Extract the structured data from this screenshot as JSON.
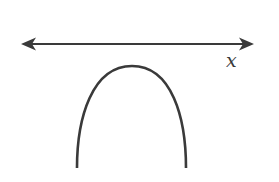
{
  "diagram": {
    "axis": {
      "label": "x",
      "orientation": "horizontal",
      "arrows": "both-ends",
      "y": 44,
      "x_start": 21,
      "x_end": 254
    },
    "curve": {
      "type": "parabola",
      "opens": "down",
      "vertex": [
        132,
        66
      ],
      "left_end": [
        77,
        168
      ],
      "right_end": [
        186,
        168
      ],
      "intersects_axis": false
    },
    "colors": {
      "stroke": "#3a3a3a",
      "background": "#ffffff"
    }
  }
}
